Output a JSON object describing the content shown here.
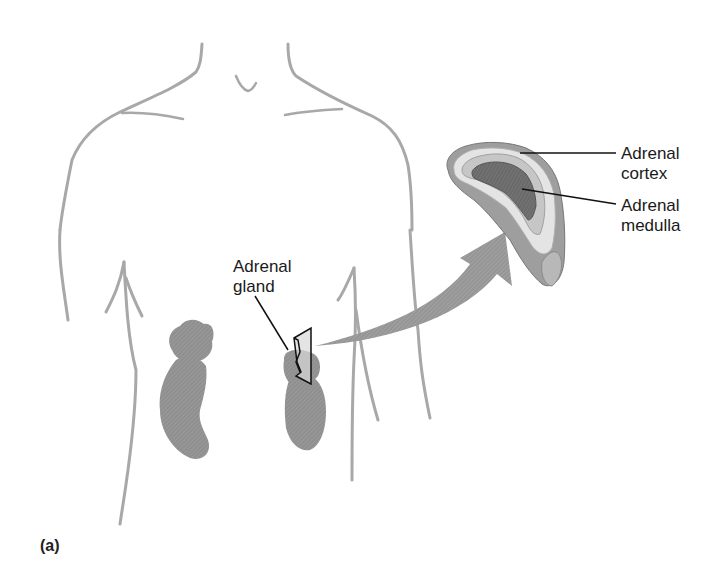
{
  "figure": {
    "panel_label": "(a)",
    "labels": {
      "adrenal_gland": "Adrenal\ngland",
      "adrenal_cortex": "Adrenal\ncortex",
      "adrenal_medulla": "Adrenal\nmedulla"
    },
    "colors": {
      "body_outline": "#a8a8a8",
      "kidney": "#8e8e8e",
      "arrow": "#9a9a9a",
      "cortex_outer": "#bdbdbd",
      "cortex_light": "#e6e6e6",
      "medulla": "#6e6e6e",
      "leader_line": "#111111"
    }
  }
}
